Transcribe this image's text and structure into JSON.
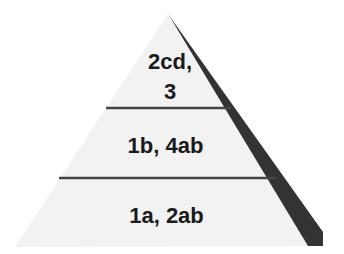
{
  "diagram": {
    "type": "pyramid",
    "tiers": [
      {
        "position": "top",
        "label_line1": "2cd,",
        "label_line2": "3"
      },
      {
        "position": "middle",
        "label": "1b, 4ab"
      },
      {
        "position": "bottom",
        "label": "1a, 2ab"
      }
    ],
    "colors": {
      "fill": "#f2f2f2",
      "shadow": "#333333",
      "divider": "#444444",
      "text": "#1a1a1a"
    }
  }
}
